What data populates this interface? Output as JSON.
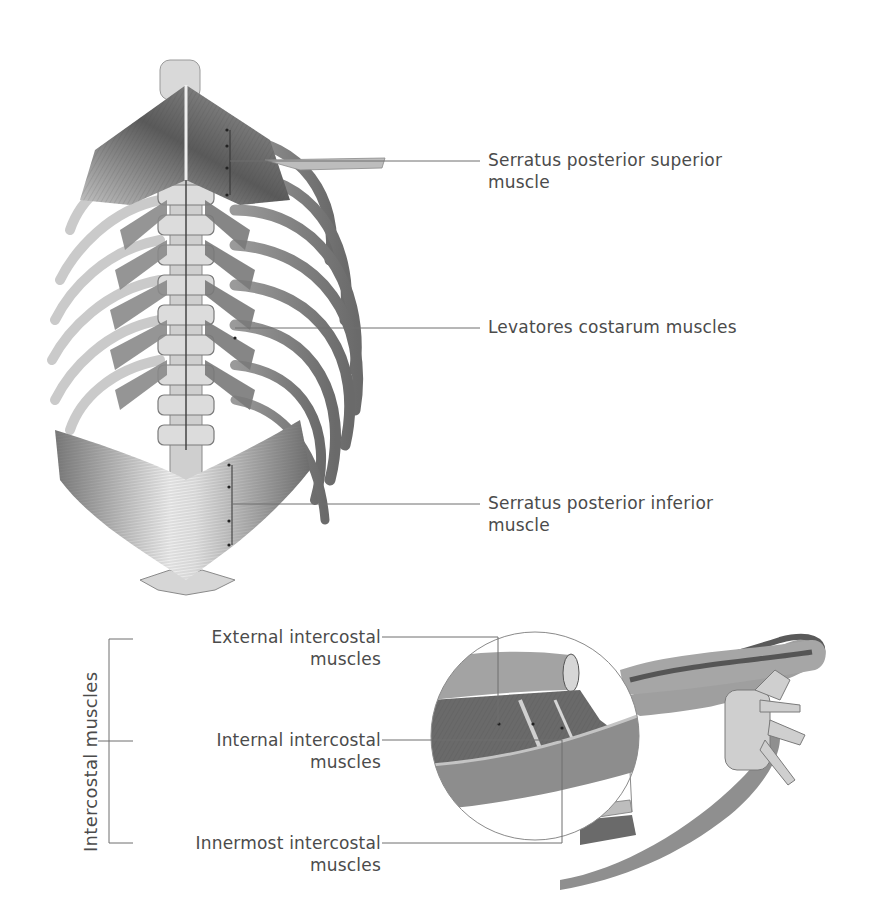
{
  "figure": {
    "type": "anatomical-illustration"
  },
  "top_labels": [
    {
      "line1": "Serratus posterior superior",
      "line2": "muscle"
    },
    {
      "line1": "Levatores costarum muscles",
      "line2": ""
    },
    {
      "line1": "Serratus posterior inferior",
      "line2": "muscle"
    }
  ],
  "intercostal_group": {
    "group_label": "Intercostal muscles",
    "labels": [
      {
        "line1": "External intercostal",
        "line2": "muscles"
      },
      {
        "line1": "Internal intercostal",
        "line2": "muscles"
      },
      {
        "line1": "Innermost intercostal",
        "line2": "muscles"
      }
    ]
  },
  "colors": {
    "leader_line": "#6e6e6e",
    "text": "#4b4b4b",
    "muscle_dark": "#5c5c5c",
    "muscle_light": "#cfcfcf",
    "bone": "#d8d8d8"
  }
}
